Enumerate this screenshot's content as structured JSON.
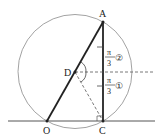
{
  "points": {
    "A": {
      "label": "A",
      "x": 103,
      "y": 22
    },
    "C": {
      "label": "C",
      "x": 103,
      "y": 121
    },
    "O": {
      "label": "O",
      "x": 47,
      "y": 121
    },
    "D": {
      "label": "D",
      "x": 75,
      "y": 72
    }
  },
  "circle": {
    "cx": 75,
    "cy": 71.5,
    "r": 57
  },
  "angles": [
    {
      "num": "π",
      "den": "3",
      "mark": "②"
    },
    {
      "num": "π",
      "den": "3",
      "mark": "①"
    }
  ],
  "colors": {
    "line": "#222222",
    "circle": "#888888",
    "dash": "#555555"
  }
}
